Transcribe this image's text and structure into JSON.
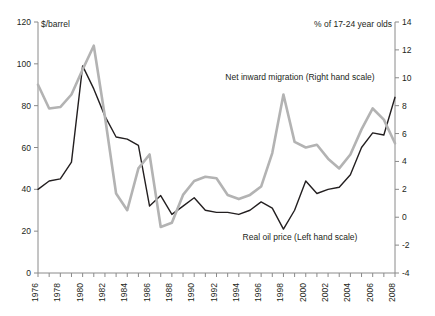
{
  "chart_data": {
    "type": "line",
    "title": "",
    "xlabel": "",
    "left_axis": {
      "label": "$/barrel",
      "min": 0,
      "max": 120,
      "step": 20,
      "ticks": [
        0,
        20,
        40,
        60,
        80,
        100,
        120
      ]
    },
    "right_axis": {
      "label": "% of 17-24 year olds",
      "min": -4,
      "max": 14,
      "step": 2,
      "ticks": [
        -4,
        -2,
        0,
        2,
        4,
        6,
        8,
        10,
        12,
        14
      ]
    },
    "x": [
      1976,
      1977,
      1978,
      1979,
      1980,
      1981,
      1982,
      1983,
      1984,
      1985,
      1986,
      1987,
      1988,
      1989,
      1990,
      1991,
      1992,
      1993,
      1994,
      1995,
      1996,
      1997,
      1998,
      1999,
      2000,
      2001,
      2002,
      2003,
      2004,
      2005,
      2006,
      2007,
      2008
    ],
    "xtick_labels": [
      "1976",
      "1978",
      "1980",
      "1982",
      "1984",
      "1986",
      "1988",
      "1990",
      "1992",
      "1994",
      "1996",
      "1998",
      "2000",
      "2002",
      "2004",
      "2006",
      "2008"
    ],
    "xtick_label_years": [
      1976,
      1978,
      1980,
      1982,
      1984,
      1986,
      1988,
      1990,
      1992,
      1994,
      1996,
      1998,
      2000,
      2002,
      2004,
      2006,
      2008
    ],
    "grid": false,
    "legend_position": "inline-annotation",
    "series": [
      {
        "name": "Real oil price (Left hand scale)",
        "axis": "left",
        "color": "#231f20",
        "annotation": "Real oil price (Left hand scale)",
        "values": [
          40,
          44,
          45,
          53,
          99,
          88,
          75,
          65,
          64,
          61,
          32,
          37,
          28,
          32,
          36,
          30,
          29,
          29,
          28,
          30,
          34,
          31,
          21,
          30,
          44,
          38,
          40,
          41,
          47,
          60,
          67,
          66,
          84
        ]
      },
      {
        "name": "Net inward migration (Right hand scale)",
        "axis": "right",
        "color": "#b3b3b3",
        "annotation": "Net inward migration (Right hand scale)",
        "values": [
          9.5,
          7.8,
          7.9,
          8.8,
          10.6,
          12.3,
          7.2,
          1.7,
          0.5,
          3.5,
          4.5,
          -0.7,
          -0.4,
          1.6,
          2.6,
          2.9,
          2.8,
          1.6,
          1.3,
          1.6,
          2.2,
          4.6,
          8.8,
          5.4,
          5.0,
          5.2,
          4.2,
          3.5,
          4.5,
          6.3,
          7.8,
          7.0,
          5.3
        ]
      }
    ],
    "annotations": [
      {
        "text": "Net inward migration (Right hand scale)",
        "x_px": 300,
        "y_px": 80
      },
      {
        "text": "Real oil price (Left hand scale)",
        "x_px": 300,
        "y_px": 240
      }
    ]
  }
}
